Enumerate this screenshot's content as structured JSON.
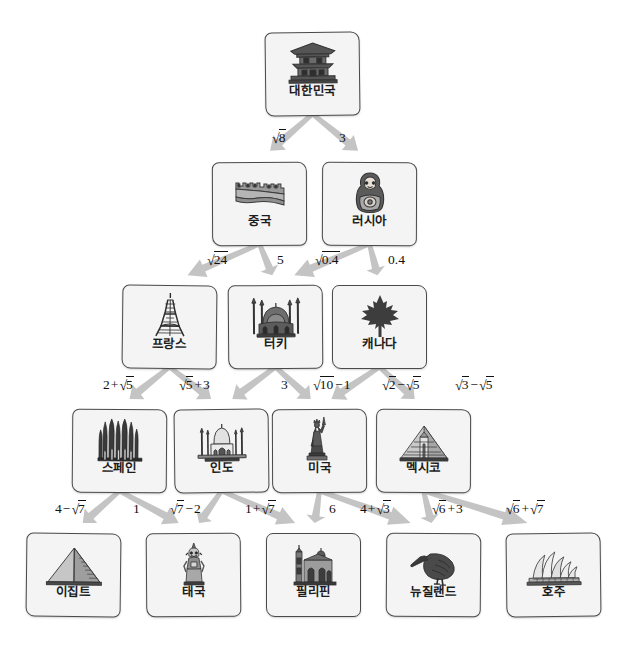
{
  "diagram": {
    "type": "tree",
    "title": "",
    "levels": 5,
    "colors": {
      "card_fill": "#f4f4f4",
      "card_border": "#4a4a4a",
      "arrow": "#c4c4c4",
      "text": "#111111"
    },
    "nodes": [
      {
        "id": "korea",
        "label": "대한민국",
        "icon": "pagoda-icon",
        "level": 1,
        "x": 265,
        "y": 32
      },
      {
        "id": "china",
        "label": "중국",
        "icon": "great-wall-icon",
        "level": 2,
        "x": 212,
        "y": 162
      },
      {
        "id": "russia",
        "label": "러시아",
        "icon": "matryoshka-icon",
        "level": 2,
        "x": 322,
        "y": 162
      },
      {
        "id": "france",
        "label": "프랑스",
        "icon": "eiffel-tower-icon",
        "level": 3,
        "x": 122,
        "y": 285
      },
      {
        "id": "turkey",
        "label": "터키",
        "icon": "blue-mosque-icon",
        "level": 3,
        "x": 228,
        "y": 285
      },
      {
        "id": "canada",
        "label": "캐나다",
        "icon": "maple-leaf-icon",
        "level": 3,
        "x": 332,
        "y": 285
      },
      {
        "id": "spain",
        "label": "스페인",
        "icon": "sagrada-familia-icon",
        "level": 4,
        "x": 72,
        "y": 409
      },
      {
        "id": "india",
        "label": "인도",
        "icon": "taj-mahal-icon",
        "level": 4,
        "x": 174,
        "y": 409
      },
      {
        "id": "usa",
        "label": "미국",
        "icon": "statue-of-liberty-icon",
        "level": 4,
        "x": 272,
        "y": 409
      },
      {
        "id": "mexico",
        "label": "멕시코",
        "icon": "mayan-pyramid-icon",
        "level": 4,
        "x": 376,
        "y": 409
      },
      {
        "id": "egypt",
        "label": "이집트",
        "icon": "pyramid-icon",
        "level": 5,
        "x": 26,
        "y": 533
      },
      {
        "id": "thailand",
        "label": "태국",
        "icon": "thai-statue-icon",
        "level": 5,
        "x": 146,
        "y": 533
      },
      {
        "id": "philippines",
        "label": "필리핀",
        "icon": "church-icon",
        "level": 5,
        "x": 266,
        "y": 533
      },
      {
        "id": "newzealand",
        "label": "뉴질랜드",
        "icon": "kiwi-bird-icon",
        "level": 5,
        "x": 386,
        "y": 533
      },
      {
        "id": "australia",
        "label": "호주",
        "icon": "opera-house-icon",
        "level": 5,
        "x": 506,
        "y": 533
      }
    ],
    "edges": [
      {
        "from": "korea",
        "to": "china",
        "label": "√8",
        "label_x": 272,
        "label_y": 131,
        "side": "left"
      },
      {
        "from": "korea",
        "to": "russia",
        "label": "3",
        "label_x": 339,
        "label_y": 131,
        "side": "right"
      },
      {
        "from": "china",
        "to": "france",
        "label": "√24",
        "label_x": 207,
        "label_y": 253,
        "side": "left"
      },
      {
        "from": "china",
        "to": "turkey",
        "label": "5",
        "label_x": 277,
        "label_y": 253,
        "side": "right"
      },
      {
        "from": "russia",
        "to": "turkey",
        "label": "√0.4",
        "label_x": 315,
        "label_y": 253,
        "side": "left"
      },
      {
        "from": "russia",
        "to": "canada",
        "label": "0.4",
        "label_x": 388,
        "label_y": 253,
        "side": "right"
      },
      {
        "from": "france",
        "to": "spain",
        "label": "2+√5",
        "label_x": 103,
        "label_y": 378,
        "side": "left"
      },
      {
        "from": "france",
        "to": "india",
        "label": "√5+3",
        "label_x": 179,
        "label_y": 378,
        "side": "right"
      },
      {
        "from": "turkey",
        "to": "india",
        "label": "3",
        "label_x": 281,
        "label_y": 378,
        "side": "left"
      },
      {
        "from": "turkey",
        "to": "usa",
        "label": "√10−1",
        "label_x": 313,
        "label_y": 378,
        "side": "right"
      },
      {
        "from": "canada",
        "to": "usa",
        "label": "√2−√5",
        "label_x": 382,
        "label_y": 378,
        "side": "left"
      },
      {
        "from": "canada",
        "to": "mexico",
        "label": "√3−√5",
        "label_x": 455,
        "label_y": 378,
        "side": "right"
      },
      {
        "from": "spain",
        "to": "egypt",
        "label": "4−√7",
        "label_x": 55,
        "label_y": 502,
        "side": "left"
      },
      {
        "from": "spain",
        "to": "thailand",
        "label": "1",
        "label_x": 133,
        "label_y": 502,
        "side": "right"
      },
      {
        "from": "india",
        "to": "thailand",
        "label": "√7−2",
        "label_x": 170,
        "label_y": 502,
        "side": "left"
      },
      {
        "from": "india",
        "to": "philippines",
        "label": "1+√7",
        "label_x": 245,
        "label_y": 502,
        "side": "right"
      },
      {
        "from": "usa",
        "to": "philippines",
        "label": "6",
        "label_x": 329,
        "label_y": 502,
        "side": "left"
      },
      {
        "from": "usa",
        "to": "newzealand",
        "label": "4+√3",
        "label_x": 360,
        "label_y": 502,
        "side": "right"
      },
      {
        "from": "mexico",
        "to": "newzealand",
        "label": "√6+3",
        "label_x": 432,
        "label_y": 502,
        "side": "left"
      },
      {
        "from": "mexico",
        "to": "australia",
        "label": "√6+√7",
        "label_x": 506,
        "label_y": 502,
        "side": "right"
      }
    ]
  }
}
